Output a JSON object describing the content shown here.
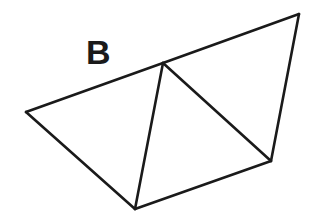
{
  "figure": {
    "label": "B",
    "label_position": {
      "x": 86,
      "y": 35
    },
    "stroke_color": "#1a1a1a",
    "stroke_width": 2.6,
    "background": "#ffffff",
    "vertices": {
      "left": [
        26,
        112
      ],
      "top_middle": [
        163,
        63
      ],
      "top_right": [
        299,
        14
      ],
      "bottom": [
        135,
        209
      ],
      "bottom_right": [
        271,
        161
      ]
    },
    "edges": [
      [
        "left",
        "top_middle"
      ],
      [
        "top_middle",
        "top_right"
      ],
      [
        "top_right",
        "bottom_right"
      ],
      [
        "bottom_right",
        "bottom"
      ],
      [
        "bottom",
        "left"
      ],
      [
        "top_middle",
        "bottom"
      ],
      [
        "top_middle",
        "bottom_right"
      ]
    ],
    "shape_description": "Pentagon net subdivided into three triangles sharing the top-middle vertex"
  }
}
